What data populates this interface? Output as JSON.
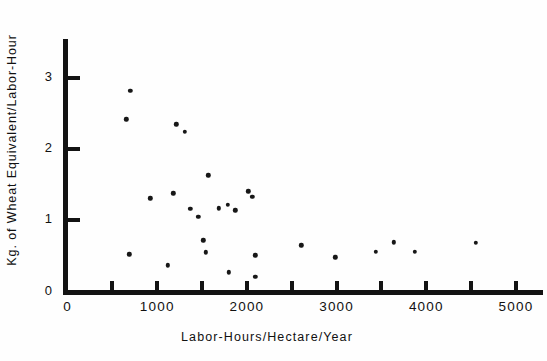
{
  "chart_data": {
    "type": "scatter",
    "title": "",
    "subtitle": "",
    "xlabel": "Labor-Hours/Hectare/Year",
    "ylabel": "Kg. of Wheat Equivalent/Labor-Hour",
    "xlim": [
      0,
      5300
    ],
    "ylim": [
      0,
      3.55
    ],
    "grid": false,
    "legend": null,
    "x_ticks_major": [
      0,
      1000,
      2000,
      3000,
      4000,
      5000
    ],
    "x_tick_labels": [
      "0",
      "1000",
      "2000",
      "3000",
      "4000",
      "5000"
    ],
    "x_ticks_all": [
      0,
      500,
      1000,
      1500,
      2000,
      2500,
      3000,
      3500,
      4000,
      4500,
      5000
    ],
    "y_ticks": [
      0,
      1,
      2,
      3
    ],
    "y_tick_labels": [
      "0",
      "1",
      "2",
      "3"
    ],
    "marker": "filled-circle",
    "marker_color": "#171717",
    "points": [
      {
        "x": 700,
        "y": 2.82
      },
      {
        "x": 655,
        "y": 2.42
      },
      {
        "x": 1215,
        "y": 2.35
      },
      {
        "x": 1305,
        "y": 2.24
      },
      {
        "x": 1570,
        "y": 1.63
      },
      {
        "x": 925,
        "y": 1.31
      },
      {
        "x": 1180,
        "y": 1.38
      },
      {
        "x": 1370,
        "y": 1.16
      },
      {
        "x": 1460,
        "y": 1.05
      },
      {
        "x": 1685,
        "y": 1.17
      },
      {
        "x": 1785,
        "y": 1.22
      },
      {
        "x": 1870,
        "y": 1.14
      },
      {
        "x": 2015,
        "y": 1.41
      },
      {
        "x": 2060,
        "y": 1.33
      },
      {
        "x": 690,
        "y": 0.52
      },
      {
        "x": 1115,
        "y": 0.37
      },
      {
        "x": 1515,
        "y": 0.72
      },
      {
        "x": 1540,
        "y": 0.55
      },
      {
        "x": 1795,
        "y": 0.27
      },
      {
        "x": 2095,
        "y": 0.51
      },
      {
        "x": 2095,
        "y": 0.21
      },
      {
        "x": 2605,
        "y": 0.65
      },
      {
        "x": 2985,
        "y": 0.48
      },
      {
        "x": 3440,
        "y": 0.56
      },
      {
        "x": 3640,
        "y": 0.69
      },
      {
        "x": 3875,
        "y": 0.56
      },
      {
        "x": 4555,
        "y": 0.68
      }
    ]
  }
}
